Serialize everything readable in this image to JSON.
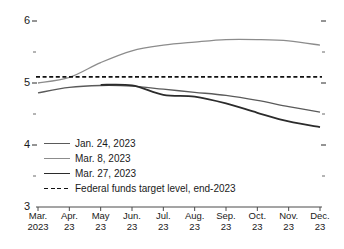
{
  "chart_data": {
    "type": "line",
    "title": "",
    "xlabel": "",
    "ylabel": "",
    "ylim": [
      3,
      6
    ],
    "yticks": [
      3,
      4,
      5,
      6
    ],
    "yticks_minor": [
      3.5,
      4.5,
      5.5
    ],
    "grid": false,
    "legend_position": "lower-left",
    "x": [
      "Mar. 2023",
      "Apr. 23",
      "May 23",
      "Jun. 23",
      "Jul. 23",
      "Aug. 23",
      "Sep. 23",
      "Oct. 23",
      "Nov. 23",
      "Dec. 23"
    ],
    "series": [
      {
        "name": "Jan. 24, 2023",
        "color": "#5a5a5a",
        "width": 1.3,
        "dash": "none",
        "values": [
          4.84,
          4.93,
          4.96,
          4.95,
          4.9,
          4.85,
          4.8,
          4.72,
          4.62,
          4.53
        ]
      },
      {
        "name": "Mar. 8, 2023",
        "color": "#8c8c8c",
        "width": 1.3,
        "dash": "none",
        "values": [
          5.0,
          5.09,
          5.33,
          5.52,
          5.61,
          5.66,
          5.7,
          5.7,
          5.68,
          5.61
        ]
      },
      {
        "name": "Mar. 27, 2023",
        "color": "#2b2b2b",
        "width": 1.8,
        "dash": "none",
        "start_index": 2,
        "values": [
          null,
          null,
          4.97,
          4.96,
          4.81,
          4.78,
          4.67,
          4.52,
          4.38,
          4.29
        ]
      },
      {
        "name": "Federal funds target level, end-2023",
        "color": "#111111",
        "width": 1.8,
        "dash": "dashed",
        "constant": 5.1,
        "values": [
          5.1,
          5.1,
          5.1,
          5.1,
          5.1,
          5.1,
          5.1,
          5.1,
          5.1,
          5.1
        ]
      }
    ],
    "ytick_labels": [
      "6",
      "5",
      "4",
      "3"
    ],
    "xtick_labels": [
      {
        "line1": "Mar.",
        "line2": "2023"
      },
      {
        "line1": "Apr.",
        "line2": "23"
      },
      {
        "line1": "May",
        "line2": "23"
      },
      {
        "line1": "Jun.",
        "line2": "23"
      },
      {
        "line1": "Jul.",
        "line2": "23"
      },
      {
        "line1": "Aug.",
        "line2": "23"
      },
      {
        "line1": "Sep.",
        "line2": "23"
      },
      {
        "line1": "Oct.",
        "line2": "23"
      },
      {
        "line1": "Nov.",
        "line2": "23"
      },
      {
        "line1": "Dec.",
        "line2": "23"
      }
    ],
    "legend": [
      {
        "label": "Jan. 24, 2023",
        "color": "#5a5a5a",
        "dash": "none",
        "width": 1.3
      },
      {
        "label": "Mar. 8, 2023",
        "color": "#8c8c8c",
        "dash": "none",
        "width": 1.3
      },
      {
        "label": "Mar. 27, 2023",
        "color": "#2b2b2b",
        "dash": "none",
        "width": 1.8
      },
      {
        "label": "Federal funds target level, end-2023",
        "color": "#111111",
        "dash": "dashed",
        "width": 1.8
      }
    ]
  }
}
